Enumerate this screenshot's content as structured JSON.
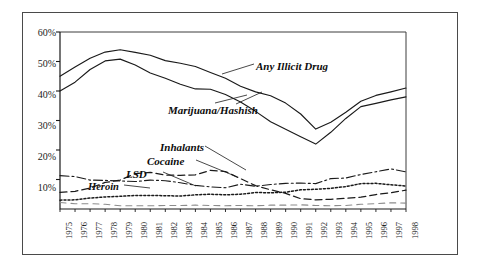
{
  "figure": {
    "frame_color": "#4a4a4a",
    "background": "#ffffff",
    "ink_color": "#1a1a1a"
  },
  "chart_data": {
    "type": "line",
    "title": "",
    "subtitle": "",
    "xlabel": "",
    "ylabel": "",
    "grid": false,
    "legend_position": "inline-annotations",
    "xlim": [
      1975,
      1998
    ],
    "ylim": [
      0,
      60
    ],
    "ytick_labels": [
      "60%",
      "50%",
      "40%",
      "30%",
      "20%",
      "10%"
    ],
    "ytick_values": [
      60,
      50,
      40,
      30,
      20,
      10
    ],
    "x": [
      1975,
      1976,
      1977,
      1978,
      1979,
      1980,
      1981,
      1982,
      1983,
      1984,
      1985,
      1986,
      1987,
      1988,
      1989,
      1990,
      1991,
      1992,
      1993,
      1994,
      1995,
      1996,
      1997,
      1998
    ],
    "xtick_labels": [
      "1975",
      "1976",
      "1977",
      "1978",
      "1979",
      "1980",
      "1981",
      "1982",
      "1983",
      "1984",
      "1985",
      "1986",
      "1987",
      "1988",
      "1989",
      "1990",
      "1991",
      "1992",
      "1993",
      "1994",
      "1995",
      "1996",
      "1997",
      "1998"
    ],
    "series": [
      {
        "name": "Any Illicit Drug",
        "label": "Any Illicit Drug",
        "style": "solid",
        "color": "#1a1a1a",
        "values": [
          45.0,
          48.1,
          51.1,
          53.2,
          54.0,
          53.1,
          52.1,
          50.3,
          49.4,
          48.3,
          46.3,
          44.3,
          41.6,
          39.7,
          38.4,
          35.9,
          32.2,
          27.1,
          29.4,
          32.8,
          36.5,
          38.5,
          39.7,
          41.0
        ]
      },
      {
        "name": "Marijuana/Hashish",
        "label": "Marijuana/Hashish",
        "style": "solid",
        "color": "#1a1a1a",
        "values": [
          40.0,
          43.0,
          47.3,
          50.2,
          50.8,
          48.8,
          46.1,
          44.3,
          42.3,
          40.7,
          40.6,
          38.8,
          36.3,
          33.1,
          29.6,
          27.0,
          24.5,
          22.0,
          26.0,
          30.7,
          34.7,
          35.8,
          37.0,
          38.0
        ]
      },
      {
        "name": "Inhalants",
        "label": "Inhalants",
        "style": "dotted",
        "color": "#1a1a1a",
        "values": [
          3.0,
          3.1,
          3.7,
          4.1,
          4.3,
          4.6,
          4.6,
          4.5,
          4.4,
          4.8,
          5.0,
          4.8,
          5.0,
          5.6,
          5.5,
          5.7,
          6.5,
          6.7,
          7.0,
          7.6,
          8.6,
          8.7,
          8.2,
          7.8
        ]
      },
      {
        "name": "Cocaine",
        "label": "Cocaine",
        "style": "dashed",
        "color": "#1a1a1a",
        "values": [
          5.6,
          6.0,
          7.1,
          9.0,
          9.8,
          12.0,
          12.4,
          11.5,
          11.4,
          11.6,
          13.1,
          12.7,
          10.3,
          7.9,
          6.5,
          5.3,
          3.5,
          3.1,
          3.3,
          3.6,
          4.0,
          4.9,
          5.5,
          6.4
        ]
      },
      {
        "name": "LSD",
        "label": "LSD",
        "style": "dashdot",
        "color": "#1a1a1a",
        "values": [
          11.3,
          11.0,
          9.8,
          9.7,
          9.5,
          9.3,
          9.8,
          9.6,
          8.9,
          8.0,
          7.5,
          7.2,
          8.4,
          7.7,
          8.3,
          8.7,
          8.8,
          8.6,
          10.3,
          10.5,
          11.7,
          12.6,
          13.6,
          12.6
        ]
      },
      {
        "name": "Heroin",
        "label": "Heroin",
        "style": "longdash-light",
        "color": "#8c8c8c",
        "values": [
          2.2,
          1.8,
          1.8,
          1.6,
          1.1,
          1.1,
          1.1,
          1.2,
          1.2,
          1.3,
          1.2,
          1.1,
          1.2,
          1.1,
          1.3,
          1.3,
          1.4,
          1.2,
          1.1,
          1.2,
          1.6,
          1.8,
          2.1,
          2.0
        ]
      }
    ],
    "annotations": [
      {
        "text": "Any Illicit Drug",
        "series": "Any Illicit Drug"
      },
      {
        "text": "Marijuana/Hashish",
        "series": "Marijuana/Hashish"
      },
      {
        "text": "Inhalants",
        "series": "Inhalants"
      },
      {
        "text": "Cocaine",
        "series": "Cocaine"
      },
      {
        "text": "LSD",
        "series": "LSD"
      },
      {
        "text": "Heroin",
        "series": "Heroin"
      }
    ]
  }
}
